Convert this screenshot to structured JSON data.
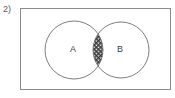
{
  "question": {
    "number_label": "2)"
  },
  "diagram": {
    "type": "venn",
    "sets": [
      {
        "id": "A",
        "label": "A",
        "center_x": 74,
        "center_y": 50,
        "radius": 29
      },
      {
        "id": "B",
        "label": "B",
        "center_x": 121,
        "center_y": 50,
        "radius": 28
      }
    ],
    "shaded_region": {
      "name": "intersection",
      "description": "A intersect B",
      "fill_style": "diagonal-crosshatch",
      "fill_color": "#3a3a3a"
    },
    "frame": {
      "border_color": "#8a8a8a",
      "background_color": "#ffffff"
    },
    "stroke_color": "#6e6e6e",
    "label_color": "#3d3d3d"
  }
}
